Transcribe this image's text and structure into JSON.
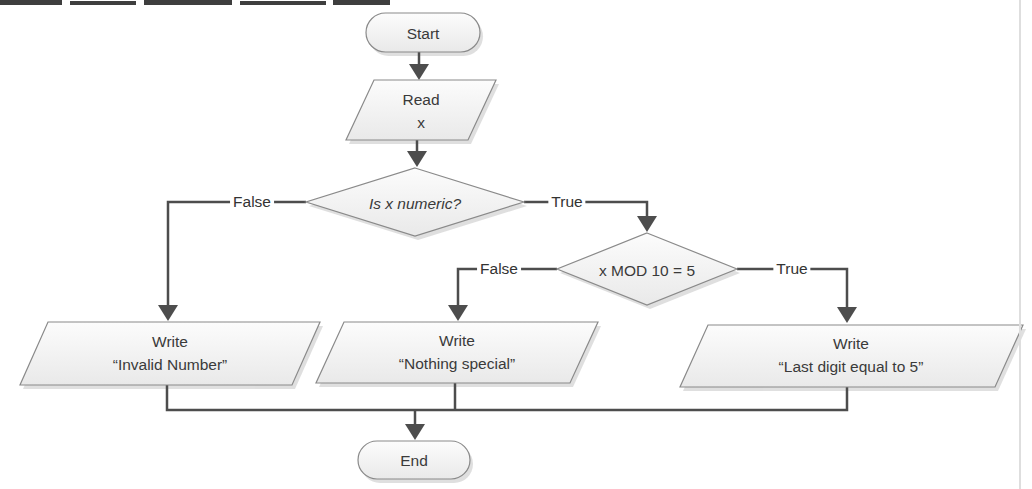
{
  "flowchart": {
    "nodes": {
      "start": {
        "type": "terminator",
        "label": "Start"
      },
      "read": {
        "type": "io",
        "line1": "Read",
        "line2": "x"
      },
      "decision_numeric": {
        "type": "decision",
        "label": "Is x numeric?",
        "italic": true
      },
      "decision_mod": {
        "type": "decision",
        "label": "x MOD 10 = 5",
        "italic": false
      },
      "write_invalid": {
        "type": "io",
        "line1": "Write",
        "line2": "“Invalid Number”"
      },
      "write_nothing": {
        "type": "io",
        "line1": "Write",
        "line2": "“Nothing special”"
      },
      "write_last_digit": {
        "type": "io",
        "line1": "Write",
        "line2": "“Last digit equal to 5”"
      },
      "end": {
        "type": "terminator",
        "label": "End"
      }
    },
    "edge_labels": {
      "numeric_false": "False",
      "numeric_true": "True",
      "mod_false": "False",
      "mod_true": "True"
    },
    "colors": {
      "background": "#ffffff",
      "shape_fill_top": "#fcfcfc",
      "shape_fill_bottom": "#e9e9e9",
      "shape_border": "#8a8a8a",
      "shape_shadow": "#cfcfcf",
      "connector": "#4d4d4d",
      "text": "#3a3a3a",
      "scan_artifact": "#232323",
      "page_edge_line": "#dedede"
    }
  }
}
